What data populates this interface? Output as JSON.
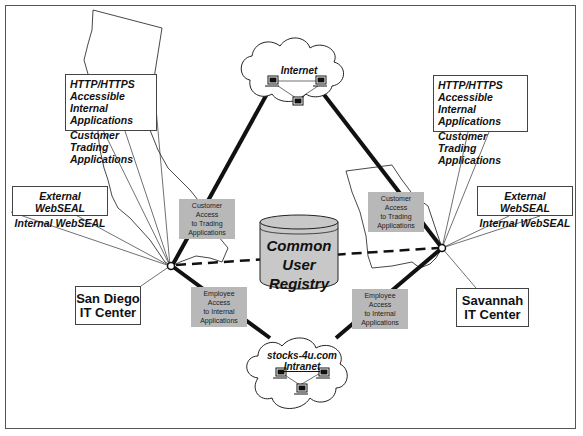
{
  "diagram": {
    "clouds": {
      "internet": {
        "label": "Internet"
      },
      "intranet": {
        "label_line1": "stocks-4u.com",
        "label_line2": "Intranet"
      }
    },
    "registry": {
      "line1": "Common",
      "line2": "User",
      "line3": "Registry"
    },
    "sites": {
      "san_diego": {
        "name_line1": "San Diego",
        "name_line2": "IT Center",
        "webseal": [
          "External WebSEAL",
          "Internal WebSEAL"
        ],
        "apps": [
          "HTTP/HTTPS",
          "Accessible Internal",
          "Applications",
          "Customer Trading",
          "Applications"
        ]
      },
      "savannah": {
        "name_line1": "Savannah",
        "name_line2": "IT Center",
        "webseal": [
          "External WebSEAL",
          "Internal WebSEAL"
        ],
        "apps": [
          "HTTP/HTTPS",
          "Accessible Internal",
          "Applications",
          "Customer Trading",
          "Applications"
        ]
      }
    },
    "link_labels": {
      "sd_customer": [
        "Customer Access",
        "to Trading",
        "Applications"
      ],
      "sv_customer": [
        "Customer Access",
        "to Trading",
        "Applications"
      ],
      "sd_employee": [
        "Employee Access",
        "to Internal",
        "Applications"
      ],
      "sv_employee": [
        "Employee Access",
        "to Internal",
        "Applications"
      ]
    },
    "colors": {
      "line": "#111111",
      "label_fill": "#b8b8b8",
      "cylinder_fill": "#c8c8c8",
      "map_outline": "#333333"
    }
  }
}
